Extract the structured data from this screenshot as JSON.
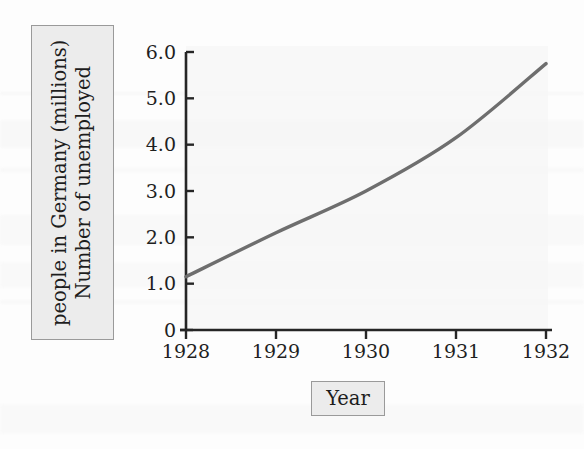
{
  "figure": {
    "y_axis_title_lines": [
      "Number of unemployed",
      "people in Germany (millions)"
    ],
    "y_axis_title": "Number of unemployed people in Germany (millions)",
    "x_axis_title": "Year"
  },
  "chart_data": {
    "type": "line",
    "title": "",
    "xlabel": "Year",
    "ylabel": "Number of unemployed people in Germany (millions)",
    "x": [
      1928,
      1929,
      1930,
      1931,
      1932
    ],
    "categories": [
      "1928",
      "1929",
      "1930",
      "1931",
      "1932"
    ],
    "values": [
      1.15,
      2.1,
      3.0,
      4.15,
      5.75
    ],
    "series": [
      {
        "name": "Number of unemployed people in Germany (millions)",
        "values": [
          1.15,
          2.1,
          3.0,
          4.15,
          5.75
        ],
        "color": "#6e6e6e"
      }
    ],
    "xlim": [
      1928,
      1932
    ],
    "ylim": [
      0,
      6.0
    ],
    "x_ticks": [
      "1928",
      "1929",
      "1930",
      "1931",
      "1932"
    ],
    "y_ticks": [
      "0",
      "1.0",
      "2.0",
      "3.0",
      "4.0",
      "5.0",
      "6.0"
    ],
    "y_tick_values": [
      0,
      1.0,
      2.0,
      3.0,
      4.0,
      5.0,
      6.0
    ],
    "grid": false,
    "legend": "none",
    "line_color": "#6e6e6e",
    "axis_color": "#262626"
  }
}
